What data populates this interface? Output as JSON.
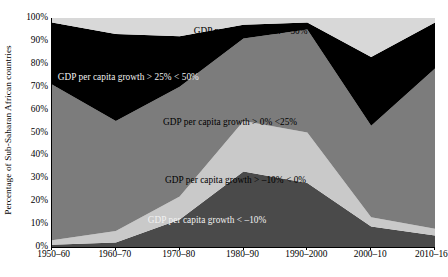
{
  "chart_data": {
    "type": "area",
    "title": "",
    "subtitle": "",
    "xlabel": "",
    "ylabel": "Percentage of Sub-Saharan African countries",
    "stacked": true,
    "stack_order": "bottom-to-top",
    "normalized_percent": true,
    "grid": false,
    "legend_position": "inside-plot-labels",
    "ylim": [
      0,
      100
    ],
    "y_ticks": [
      "0%",
      "10%",
      "20%",
      "30%",
      "40%",
      "50%",
      "60%",
      "70%",
      "80%",
      "90%",
      "100%"
    ],
    "y_tick_values": [
      0,
      10,
      20,
      30,
      40,
      50,
      60,
      70,
      80,
      90,
      100
    ],
    "categories": [
      "1950–60",
      "1960–70",
      "1970–80",
      "1980–90",
      "1990–2000",
      "2000–10",
      "2010–16"
    ],
    "series": [
      {
        "name": "GDP per capita growth < –10%",
        "color": "#4a4a4a",
        "values": [
          1,
          2,
          12,
          33,
          28,
          9,
          5
        ]
      },
      {
        "name": "GDP per capita growth > –10% < 0%",
        "color": "#c9c9c9",
        "values": [
          2,
          5,
          10,
          22,
          22,
          4,
          3
        ]
      },
      {
        "name": "GDP per capita growth > 0% <25%",
        "color": "#7c7c7c",
        "values": [
          68,
          48,
          48,
          36,
          45,
          40,
          70
        ]
      },
      {
        "name": "GDP per capita growth > 25% < 50%",
        "color": "#000000",
        "values": [
          27,
          38,
          22,
          6,
          3,
          30,
          20
        ]
      },
      {
        "name": "GDP per capita growth > 50%",
        "color": "#d8d8d8",
        "values": [
          2,
          7,
          8,
          3,
          2,
          17,
          2
        ]
      }
    ],
    "band_labels": [
      {
        "text": "GDP per capita growth > 50%",
        "x_pct": 37.0,
        "y_pct": 4.0,
        "tone": "dark"
      },
      {
        "text": "GDP per capita growth > 25% < 50%",
        "x_pct": 1.5,
        "y_pct": 24.0,
        "tone": "light"
      },
      {
        "text": "GDP per capita growth > 0% <25%",
        "x_pct": 29.0,
        "y_pct": 43.5,
        "tone": "dark"
      },
      {
        "text": "GDP per capita growth > –10% < 0%",
        "x_pct": 29.5,
        "y_pct": 69.0,
        "tone": "dark"
      },
      {
        "text": "GDP per capita growth < –10%",
        "x_pct": 25.0,
        "y_pct": 86.5,
        "tone": "light"
      }
    ]
  }
}
